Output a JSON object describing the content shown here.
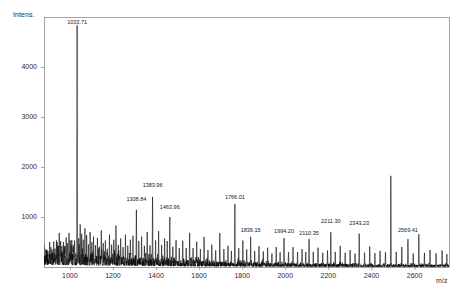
{
  "chart_data": {
    "type": "line",
    "title": "",
    "subtitle": "",
    "xlabel": "m/z",
    "ylabel": "Intens.",
    "grid": false,
    "legend": "none",
    "xlim": [
      880,
      2760
    ],
    "ylim": [
      0,
      5000
    ],
    "xticks": [
      1000,
      1200,
      1400,
      1600,
      1800,
      2000,
      2200,
      2400,
      2600
    ],
    "yticks": [
      1000,
      2000,
      3000,
      4000
    ],
    "xtick_labels": [
      "1000",
      "1200",
      "1400",
      "1600",
      "1800",
      "2000",
      "2200",
      "2400",
      "2600"
    ],
    "ytick_labels": [
      "1000",
      "2000",
      "3000",
      "4000"
    ],
    "annotations": [
      {
        "label": "1033.71",
        "mz": 1033.71,
        "intensity": 5600
      },
      {
        "label": "1308.84",
        "mz": 1308.84,
        "intensity": 1250
      },
      {
        "label": "1383.96",
        "mz": 1383.96,
        "intensity": 1530
      },
      {
        "label": "1463.96",
        "mz": 1463.96,
        "intensity": 1080
      },
      {
        "label": "1766.01",
        "mz": 1766.01,
        "intensity": 1290
      },
      {
        "label": "1839.15",
        "mz": 1839.15,
        "intensity": 620
      },
      {
        "label": "1994.20",
        "mz": 1994.2,
        "intensity": 610
      },
      {
        "label": "2110.35",
        "mz": 2110.35,
        "intensity": 560
      },
      {
        "label": "2211.30",
        "mz": 2211.3,
        "intensity": 800
      },
      {
        "label": "2343.23",
        "mz": 2343.23,
        "intensity": 760
      },
      {
        "label": "2569.41",
        "mz": 2569.41,
        "intensity": 620
      }
    ],
    "peaks": [
      {
        "mz": 905,
        "intensity": 300
      },
      {
        "mz": 912,
        "intensity": 420
      },
      {
        "mz": 918,
        "intensity": 355
      },
      {
        "mz": 925,
        "intensity": 540
      },
      {
        "mz": 931,
        "intensity": 400
      },
      {
        "mz": 938,
        "intensity": 610
      },
      {
        "mz": 944,
        "intensity": 460
      },
      {
        "mz": 951,
        "intensity": 700
      },
      {
        "mz": 957,
        "intensity": 520
      },
      {
        "mz": 963,
        "intensity": 430
      },
      {
        "mz": 970,
        "intensity": 560
      },
      {
        "mz": 976,
        "intensity": 470
      },
      {
        "mz": 983,
        "intensity": 640
      },
      {
        "mz": 989,
        "intensity": 500
      },
      {
        "mz": 996,
        "intensity": 700
      },
      {
        "mz": 1002,
        "intensity": 560
      },
      {
        "mz": 1009,
        "intensity": 620
      },
      {
        "mz": 1016,
        "intensity": 480
      },
      {
        "mz": 1022,
        "intensity": 560
      },
      {
        "mz": 1033.71,
        "intensity": 5600
      },
      {
        "mz": 1041,
        "intensity": 620
      },
      {
        "mz": 1048,
        "intensity": 980
      },
      {
        "mz": 1055,
        "intensity": 700
      },
      {
        "mz": 1062,
        "intensity": 560
      },
      {
        "mz": 1070,
        "intensity": 890
      },
      {
        "mz": 1078,
        "intensity": 640
      },
      {
        "mz": 1086,
        "intensity": 520
      },
      {
        "mz": 1094,
        "intensity": 720
      },
      {
        "mz": 1102,
        "intensity": 560
      },
      {
        "mz": 1110,
        "intensity": 640
      },
      {
        "mz": 1119,
        "intensity": 500
      },
      {
        "mz": 1128,
        "intensity": 600
      },
      {
        "mz": 1137,
        "intensity": 440
      },
      {
        "mz": 1146,
        "intensity": 820
      },
      {
        "mz": 1155,
        "intensity": 480
      },
      {
        "mz": 1165,
        "intensity": 560
      },
      {
        "mz": 1174,
        "intensity": 420
      },
      {
        "mz": 1184,
        "intensity": 700
      },
      {
        "mz": 1194,
        "intensity": 460
      },
      {
        "mz": 1204,
        "intensity": 560
      },
      {
        "mz": 1214,
        "intensity": 900
      },
      {
        "mz": 1225,
        "intensity": 480
      },
      {
        "mz": 1236,
        "intensity": 620
      },
      {
        "mz": 1247,
        "intensity": 430
      },
      {
        "mz": 1258,
        "intensity": 700
      },
      {
        "mz": 1269,
        "intensity": 460
      },
      {
        "mz": 1281,
        "intensity": 560
      },
      {
        "mz": 1293,
        "intensity": 640
      },
      {
        "mz": 1308.84,
        "intensity": 1250
      },
      {
        "mz": 1320,
        "intensity": 520
      },
      {
        "mz": 1333,
        "intensity": 680
      },
      {
        "mz": 1346,
        "intensity": 460
      },
      {
        "mz": 1359,
        "intensity": 720
      },
      {
        "mz": 1372,
        "intensity": 500
      },
      {
        "mz": 1383.96,
        "intensity": 1530
      },
      {
        "mz": 1398,
        "intensity": 560
      },
      {
        "mz": 1412,
        "intensity": 780
      },
      {
        "mz": 1426,
        "intensity": 480
      },
      {
        "mz": 1440,
        "intensity": 600
      },
      {
        "mz": 1452,
        "intensity": 520
      },
      {
        "mz": 1463.96,
        "intensity": 1080
      },
      {
        "mz": 1478,
        "intensity": 440
      },
      {
        "mz": 1493,
        "intensity": 620
      },
      {
        "mz": 1508,
        "intensity": 400
      },
      {
        "mz": 1524,
        "intensity": 540
      },
      {
        "mz": 1540,
        "intensity": 380
      },
      {
        "mz": 1556,
        "intensity": 700
      },
      {
        "mz": 1572,
        "intensity": 400
      },
      {
        "mz": 1589,
        "intensity": 520
      },
      {
        "mz": 1606,
        "intensity": 360
      },
      {
        "mz": 1623,
        "intensity": 620
      },
      {
        "mz": 1641,
        "intensity": 380
      },
      {
        "mz": 1659,
        "intensity": 500
      },
      {
        "mz": 1677,
        "intensity": 340
      },
      {
        "mz": 1696,
        "intensity": 760
      },
      {
        "mz": 1715,
        "intensity": 380
      },
      {
        "mz": 1734,
        "intensity": 460
      },
      {
        "mz": 1750,
        "intensity": 340
      },
      {
        "mz": 1766.01,
        "intensity": 1290
      },
      {
        "mz": 1784,
        "intensity": 420
      },
      {
        "mz": 1803,
        "intensity": 560
      },
      {
        "mz": 1821,
        "intensity": 360
      },
      {
        "mz": 1839.15,
        "intensity": 620
      },
      {
        "mz": 1858,
        "intensity": 340
      },
      {
        "mz": 1878,
        "intensity": 480
      },
      {
        "mz": 1898,
        "intensity": 320
      },
      {
        "mz": 1918,
        "intensity": 420
      },
      {
        "mz": 1938,
        "intensity": 300
      },
      {
        "mz": 1958,
        "intensity": 400
      },
      {
        "mz": 1976,
        "intensity": 320
      },
      {
        "mz": 1994.2,
        "intensity": 610
      },
      {
        "mz": 2015,
        "intensity": 330
      },
      {
        "mz": 2036,
        "intensity": 420
      },
      {
        "mz": 2057,
        "intensity": 300
      },
      {
        "mz": 2078,
        "intensity": 380
      },
      {
        "mz": 2095,
        "intensity": 310
      },
      {
        "mz": 2110.35,
        "intensity": 560
      },
      {
        "mz": 2130,
        "intensity": 330
      },
      {
        "mz": 2152,
        "intensity": 420
      },
      {
        "mz": 2174,
        "intensity": 310
      },
      {
        "mz": 2196,
        "intensity": 360
      },
      {
        "mz": 2211.3,
        "intensity": 800
      },
      {
        "mz": 2232,
        "intensity": 320
      },
      {
        "mz": 2255,
        "intensity": 420
      },
      {
        "mz": 2278,
        "intensity": 300
      },
      {
        "mz": 2301,
        "intensity": 380
      },
      {
        "mz": 2324,
        "intensity": 310
      },
      {
        "mz": 2343.23,
        "intensity": 760
      },
      {
        "mz": 2368,
        "intensity": 330
      },
      {
        "mz": 2392,
        "intensity": 420
      },
      {
        "mz": 2416,
        "intensity": 300
      },
      {
        "mz": 2440,
        "intensity": 360
      },
      {
        "mz": 2465,
        "intensity": 310
      },
      {
        "mz": 2490,
        "intensity": 1980
      },
      {
        "mz": 2515,
        "intensity": 330
      },
      {
        "mz": 2541,
        "intensity": 400
      },
      {
        "mz": 2569.41,
        "intensity": 620
      },
      {
        "mz": 2594,
        "intensity": 300
      },
      {
        "mz": 2620,
        "intensity": 730
      },
      {
        "mz": 2646,
        "intensity": 290
      },
      {
        "mz": 2672,
        "intensity": 360
      },
      {
        "mz": 2700,
        "intensity": 280
      },
      {
        "mz": 2728,
        "intensity": 330
      },
      {
        "mz": 2750,
        "intensity": 260
      }
    ]
  },
  "axes": {
    "y_title": "Intens.",
    "x_title": "m/z"
  },
  "colors": {
    "trace": "#0d0d0d",
    "frame": "#8c8c8c",
    "text": "#2b2b2b"
  }
}
